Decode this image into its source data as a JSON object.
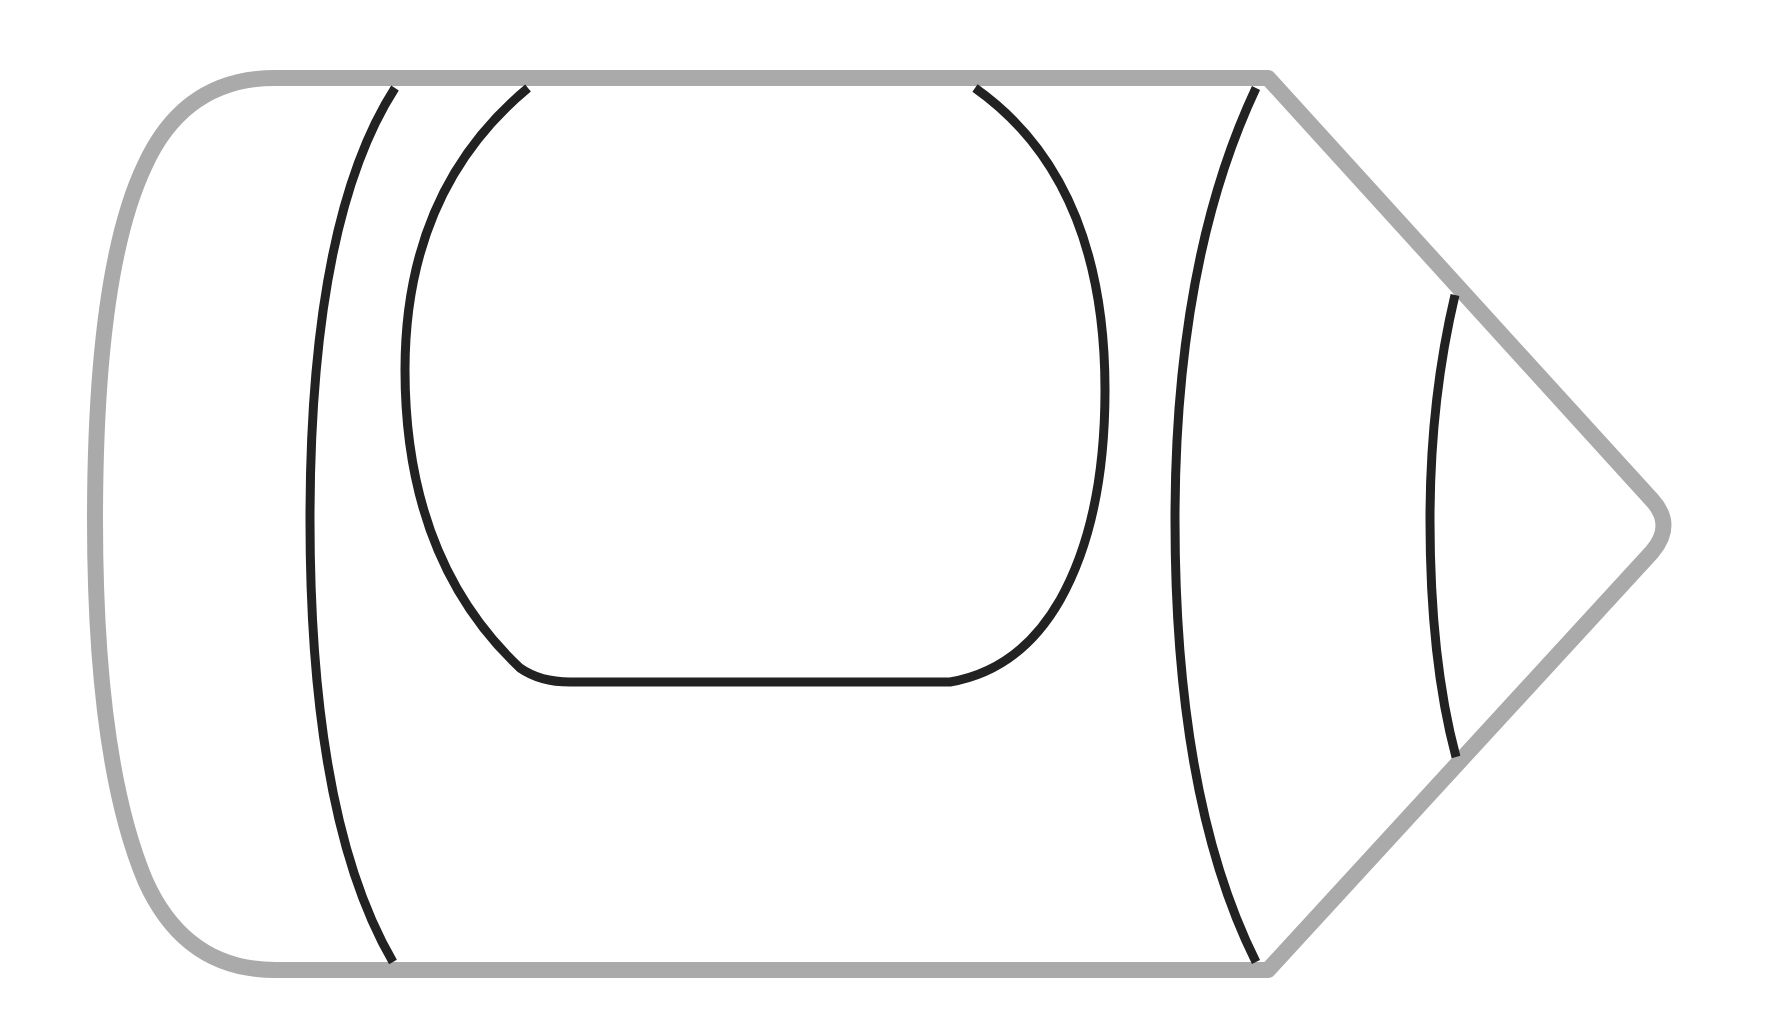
{
  "figure": {
    "colors": {
      "background": "#ffffff",
      "outline": "#aaaaaa",
      "inner_lines": "#222222"
    },
    "parts": [
      {
        "name": "body-outline",
        "label": "Crayon body outline"
      },
      {
        "name": "left-band",
        "label": "Left wrapper band"
      },
      {
        "name": "label-panel",
        "label": "Wrapper label panel"
      },
      {
        "name": "right-band",
        "label": "Right wrapper band"
      },
      {
        "name": "tip-band",
        "label": "Tip band"
      }
    ]
  }
}
